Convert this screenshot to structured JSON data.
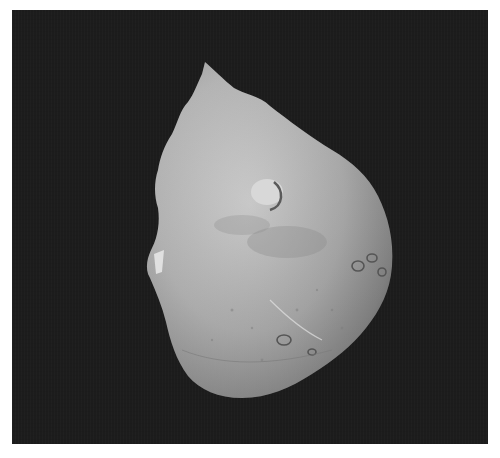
{
  "image": {
    "subject": "comet nucleus",
    "description": "Grayscale photograph of an irregular, potato-shaped comet nucleus against a dark background",
    "colors": {
      "background": "#1c1c1c",
      "page": "#ffffff",
      "surface_light": "#c8c8c8",
      "surface_mid": "#a4a4a4",
      "surface_dark": "#6e6e6e"
    }
  }
}
